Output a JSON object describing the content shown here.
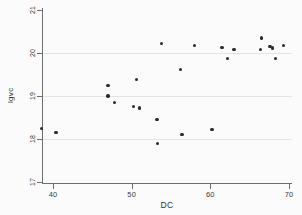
{
  "chart_data": {
    "type": "scatter",
    "title": "",
    "xlabel": "DC",
    "ylabel": "lgvc",
    "xlim": [
      37.5,
      70.5
    ],
    "ylim": [
      17,
      21
    ],
    "xticks": [
      40,
      50,
      60,
      70
    ],
    "yticks": [
      17,
      18,
      19,
      20,
      21
    ],
    "grid": "horizontal",
    "legend": "none",
    "marker": "filled-circle",
    "marker_color": "#2b2b2b",
    "background_color": "#fbfbfb",
    "axis_color": "#6e6e6e",
    "gridline_color": "#e4e4e4",
    "series": [
      {
        "name": "lgvc vs DC",
        "points": [
          {
            "x": 38.5,
            "y": 18.25
          },
          {
            "x": 40.4,
            "y": 18.15
          },
          {
            "x": 47.0,
            "y": 19.25
          },
          {
            "x": 47.0,
            "y": 19.0
          },
          {
            "x": 47.8,
            "y": 18.85
          },
          {
            "x": 50.2,
            "y": 18.75
          },
          {
            "x": 50.6,
            "y": 19.38
          },
          {
            "x": 51.0,
            "y": 18.72
          },
          {
            "x": 53.2,
            "y": 18.45
          },
          {
            "x": 53.3,
            "y": 17.9
          },
          {
            "x": 53.8,
            "y": 20.22
          },
          {
            "x": 56.2,
            "y": 19.62
          },
          {
            "x": 56.4,
            "y": 18.1
          },
          {
            "x": 58.0,
            "y": 20.18
          },
          {
            "x": 60.2,
            "y": 18.22
          },
          {
            "x": 61.5,
            "y": 20.13
          },
          {
            "x": 62.2,
            "y": 19.87
          },
          {
            "x": 63.0,
            "y": 20.08
          },
          {
            "x": 66.5,
            "y": 20.35
          },
          {
            "x": 66.4,
            "y": 20.08
          },
          {
            "x": 67.6,
            "y": 20.15
          },
          {
            "x": 67.9,
            "y": 20.12
          },
          {
            "x": 68.3,
            "y": 19.87
          },
          {
            "x": 69.3,
            "y": 20.17
          }
        ]
      }
    ]
  }
}
